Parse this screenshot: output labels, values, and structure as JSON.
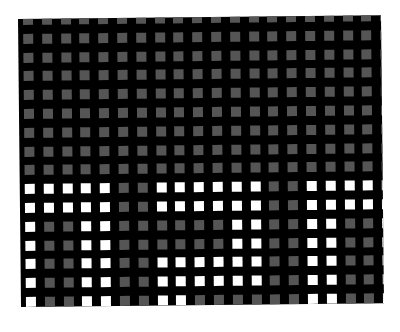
{
  "image": {
    "description": "Grid of small squares on a black board; upper rows all gray, lower rows mix white and gray squares",
    "background_color": "#ffffff",
    "board_color": "#000000"
  },
  "grid": {
    "columns": 20,
    "rows": 16,
    "pitch_px": 18.8,
    "cell_size_px": 10,
    "first_cell_center": [
      10,
      1
    ],
    "colors": {
      "0": "#555555",
      "1": "#ffffff"
    },
    "legend": {
      "0": "gray square",
      "1": "white square"
    },
    "matrix": [
      [
        0,
        0,
        0,
        0,
        0,
        0,
        0,
        0,
        0,
        0,
        0,
        0,
        0,
        0,
        0,
        0,
        0,
        0,
        0,
        0
      ],
      [
        0,
        0,
        0,
        0,
        0,
        0,
        0,
        0,
        0,
        0,
        0,
        0,
        0,
        0,
        0,
        0,
        0,
        0,
        0,
        0
      ],
      [
        0,
        0,
        0,
        0,
        0,
        0,
        0,
        0,
        0,
        0,
        0,
        0,
        0,
        0,
        0,
        0,
        0,
        0,
        0,
        0
      ],
      [
        0,
        0,
        0,
        0,
        0,
        0,
        0,
        0,
        0,
        0,
        0,
        0,
        0,
        0,
        0,
        0,
        0,
        0,
        0,
        0
      ],
      [
        0,
        0,
        0,
        0,
        0,
        0,
        0,
        0,
        0,
        0,
        0,
        0,
        0,
        0,
        0,
        0,
        0,
        0,
        0,
        0
      ],
      [
        0,
        0,
        0,
        0,
        0,
        0,
        0,
        0,
        0,
        0,
        0,
        0,
        0,
        0,
        0,
        0,
        0,
        0,
        0,
        0
      ],
      [
        0,
        0,
        0,
        0,
        0,
        0,
        0,
        0,
        0,
        0,
        0,
        0,
        0,
        0,
        0,
        0,
        0,
        0,
        0,
        0
      ],
      [
        0,
        0,
        0,
        0,
        0,
        0,
        0,
        0,
        0,
        0,
        0,
        0,
        0,
        0,
        0,
        0,
        0,
        0,
        0,
        0
      ],
      [
        0,
        0,
        0,
        0,
        0,
        0,
        0,
        0,
        0,
        0,
        0,
        0,
        0,
        0,
        0,
        0,
        0,
        0,
        0,
        0
      ],
      [
        1,
        1,
        1,
        1,
        1,
        0,
        0,
        1,
        1,
        1,
        1,
        1,
        1,
        0,
        0,
        1,
        1,
        1,
        1,
        1
      ],
      [
        1,
        1,
        1,
        1,
        1,
        0,
        0,
        1,
        1,
        1,
        1,
        1,
        1,
        0,
        0,
        1,
        1,
        1,
        1,
        1
      ],
      [
        1,
        0,
        0,
        1,
        1,
        0,
        0,
        0,
        0,
        0,
        0,
        1,
        1,
        0,
        0,
        1,
        1,
        0,
        0,
        1
      ],
      [
        1,
        0,
        0,
        1,
        1,
        0,
        0,
        0,
        0,
        0,
        0,
        1,
        1,
        0,
        0,
        1,
        1,
        0,
        0,
        1
      ],
      [
        1,
        0,
        0,
        1,
        1,
        0,
        0,
        1,
        1,
        1,
        1,
        1,
        1,
        0,
        0,
        1,
        1,
        0,
        0,
        1
      ],
      [
        1,
        0,
        0,
        1,
        1,
        0,
        0,
        1,
        1,
        1,
        1,
        1,
        1,
        0,
        0,
        1,
        1,
        0,
        0,
        1
      ],
      [
        1,
        0,
        0,
        1,
        1,
        0,
        0,
        1,
        1,
        0,
        0,
        0,
        0,
        0,
        0,
        1,
        1,
        0,
        0,
        1
      ]
    ]
  }
}
